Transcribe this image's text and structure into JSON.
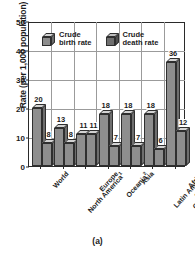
{
  "figure": {
    "caption": "(a)"
  },
  "chart_data": {
    "type": "bar",
    "title": "",
    "xlabel": "",
    "ylabel": "Rate (per 1,000 population)",
    "ylim": [
      0,
      50
    ],
    "yticks": [
      0,
      10,
      20,
      30,
      40,
      50
    ],
    "grid": "horizontal-and-vertical",
    "legend_position": "top-inside",
    "categories": [
      "World",
      "North America",
      "Europe",
      "Oceania",
      "Asia",
      "Latin America and the Caribbean",
      "Africa"
    ],
    "category_footnotes": [
      "",
      "1",
      "",
      "2",
      "",
      "",
      ""
    ],
    "category_lines": [
      [
        "World"
      ],
      [
        "North America"
      ],
      [
        "Europe"
      ],
      [
        "Oceania"
      ],
      [
        "Asia"
      ],
      [
        "Latin America",
        "and the",
        "Caribbean"
      ],
      [
        "Africa"
      ]
    ],
    "series": [
      {
        "name": "Crude birth rate",
        "values": [
          20,
          13,
          11,
          18,
          18,
          18,
          36
        ]
      },
      {
        "name": "Crude death rate",
        "values": [
          8,
          8,
          11,
          7,
          7,
          6,
          12
        ]
      }
    ]
  },
  "legend": {
    "items": [
      {
        "label_line1": "Crude",
        "label_line2": "birth rate"
      },
      {
        "label_line1": "Crude",
        "label_line2": "death rate"
      }
    ]
  },
  "colors": {
    "bar_face": "#8e8e8e",
    "bar_top": "#d3d3d3",
    "bar_side": "#6e6e6e",
    "axis": "#2a2a2a",
    "grid": "#9b9b9b",
    "text": "#1b1b1b",
    "background": "#ffffff"
  }
}
